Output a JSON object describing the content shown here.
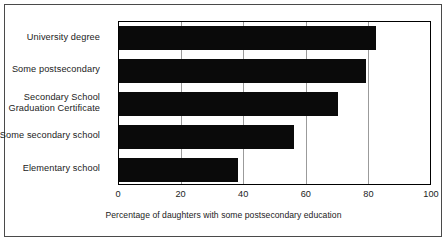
{
  "chart_data": {
    "type": "bar",
    "orientation": "horizontal",
    "title": "",
    "xlabel": "Percentage of daughters with some postsecondary education",
    "ylabel": "",
    "categories": [
      "University degree",
      "Some postsecondary",
      "Secondary School Graduation Certificate",
      "Some secondary school",
      "Elementary school"
    ],
    "values": [
      82,
      79,
      70,
      56,
      38
    ],
    "xlim": [
      0,
      100
    ],
    "xticks": [
      0,
      20,
      40,
      60,
      80,
      100
    ],
    "xtick_labels": [
      "0",
      "20",
      "40",
      "60",
      "80",
      "100"
    ],
    "grid": "vertical",
    "legend": "none",
    "bar_color": "#0a0a0a"
  },
  "labels": {
    "category_lines": [
      [
        "University degree"
      ],
      [
        "Some postsecondary"
      ],
      [
        "Secondary School",
        "Graduation Certificate"
      ],
      [
        "Some secondary school"
      ],
      [
        "Elementary school"
      ]
    ]
  },
  "colors": {
    "bar": "#0a0a0a",
    "gridline": "#9b9b9b",
    "axis": "#000000",
    "frame": "#4a4a4a",
    "text": "#222222",
    "background": "#ffffff"
  }
}
